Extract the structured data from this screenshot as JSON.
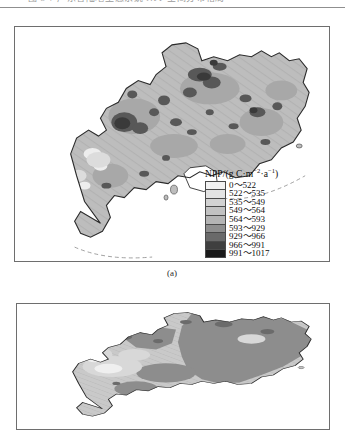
{
  "page": {
    "header_remnant_text": "图 5-7   广东省陆地生态系统 NPP 空间分布格局"
  },
  "figure": {
    "panels": [
      {
        "id": "a",
        "caption": "(a)",
        "region_name": "Guangdong Province"
      },
      {
        "id": "b",
        "caption": "",
        "region_name": "Guangdong Province"
      }
    ]
  },
  "legend": {
    "title_main": "NPP/(g C·m",
    "title_sup1": "−2",
    "title_mid": "·a",
    "title_sup2": "−1",
    "title_end": ")",
    "title_plain": "NPP/(g C·m−2·a−1)",
    "items": [
      {
        "label": "0～522",
        "color": "#f2f2f2"
      },
      {
        "label": "522～535",
        "color": "#e3e3e3"
      },
      {
        "label": "535～549",
        "color": "#d2d2d2"
      },
      {
        "label": "549～564",
        "color": "#c2c2c2"
      },
      {
        "label": "564～593",
        "color": "#b4b4b4"
      },
      {
        "label": "593～929",
        "color": "#8e8e8e"
      },
      {
        "label": "929～966",
        "color": "#6a6a6a"
      },
      {
        "label": "966～991",
        "color": "#3f3f3f"
      },
      {
        "label": "991～1017",
        "color": "#1a1a1a"
      }
    ]
  },
  "map_data": {
    "type": "choropleth",
    "variable": "NPP",
    "unit": "g C·m−2·a−1",
    "value_range": [
      0,
      1017
    ],
    "class_breaks": [
      0,
      522,
      535,
      549,
      564,
      593,
      929,
      966,
      991,
      1017
    ],
    "base_fill_a": "#bdbdbd",
    "base_fill_b": "#c9c9c9",
    "outline_color": "#333333",
    "water_fill": "#ffffff"
  }
}
